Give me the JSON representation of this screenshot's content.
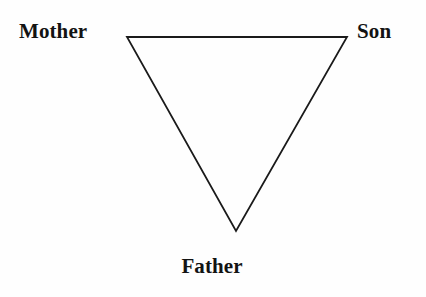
{
  "diagram": {
    "shape": "inverted-triangle",
    "background_color": "#fefefe",
    "stroke_color": "#1a1a1a",
    "stroke_width": 1.8,
    "canvas": {
      "width": 426,
      "height": 297
    },
    "vertices": [
      {
        "id": "mother",
        "label": "Mother",
        "x": 127,
        "y": 37,
        "label_position": "left"
      },
      {
        "id": "son",
        "label": "Son",
        "x": 347,
        "y": 37,
        "label_position": "right"
      },
      {
        "id": "father",
        "label": "Father",
        "x": 236,
        "y": 231,
        "label_position": "below"
      }
    ],
    "edges": [
      {
        "from": "mother",
        "to": "son"
      },
      {
        "from": "son",
        "to": "father"
      },
      {
        "from": "father",
        "to": "mother"
      }
    ],
    "labels": {
      "mother": "Mother",
      "son": "Son",
      "father": "Father"
    }
  }
}
